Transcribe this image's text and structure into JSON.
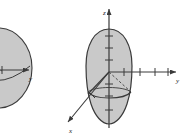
{
  "figure": {
    "title": "",
    "background_color": "#ffffff",
    "solid_fill": "#c9c9c9",
    "solid_stroke": "#3a3a3a",
    "axis_color": "#3a3a3a",
    "dashed_color": "#4a4a4a",
    "panels": [
      {
        "id": "left-panel",
        "name": "left-solid-figure",
        "cropped": true,
        "description": "Partially cropped shaded solid of revolution with horizontal y-axis and arrowhead",
        "axes": [
          {
            "name": "y-axis",
            "label": "y",
            "direction": "right",
            "tick_count": 1
          }
        ],
        "solid_shape": "ellipsoid",
        "has_dashed_cone": true
      },
      {
        "id": "right-panel",
        "name": "right-solid-figure",
        "cropped": false,
        "description": "Shaded egg-shaped solid of revolution centered on z-axis with an inscribed cone, cut by a horizontal elliptical cross-section",
        "axes": [
          {
            "name": "z-axis",
            "label": "z",
            "direction": "up",
            "tick_count": 6
          },
          {
            "name": "y-axis",
            "label": "y",
            "direction": "right",
            "tick_count": 4
          },
          {
            "name": "x-axis",
            "label": "x",
            "direction": "down-left",
            "tick_count": 1
          }
        ],
        "solid_shape": "ellipsoid",
        "has_dashed_cone": true,
        "has_cross_section_ellipse": true
      }
    ],
    "labels": {
      "left_y": "y",
      "right_z": "z",
      "right_y": "y",
      "right_x": "x"
    }
  }
}
